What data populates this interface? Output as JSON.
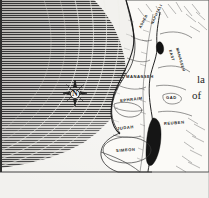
{
  "figure": {
    "kind": "historical-map-engraving",
    "width": 209,
    "height": 198
  },
  "compass": {
    "name": "compass-rose",
    "north_letter": "N"
  },
  "water": {
    "sea_hatch_dark": "#3f3f3f",
    "sea_hatch_light": "#d8d6d2",
    "inland_water_fill": "#111111"
  },
  "colors": {
    "paper": "#f2f1ee",
    "ink": "#1b1b1b",
    "land_fill": "#fbfaf7",
    "border_ink": "#2e2e2e"
  },
  "labels": [
    {
      "id": "asher",
      "text": "ASHER",
      "x": 140,
      "y": 26,
      "rotate": -62,
      "size": "sm"
    },
    {
      "id": "naphtali",
      "text": "NAPHTALI",
      "x": 152,
      "y": 22,
      "rotate": -64,
      "size": "sm"
    },
    {
      "id": "manasseh",
      "text": "MANASSEH",
      "x": 131,
      "y": 76,
      "rotate": 0,
      "size": "md"
    },
    {
      "id": "ephraim",
      "text": "EPHRAIM",
      "x": 128,
      "y": 99,
      "rotate": -6,
      "size": "md"
    },
    {
      "id": "judah",
      "text": "JUDAH",
      "x": 121,
      "y": 127,
      "rotate": -6,
      "size": "md"
    },
    {
      "id": "simeon",
      "text": "SIMEON",
      "x": 120,
      "y": 149,
      "rotate": -4,
      "size": "md"
    },
    {
      "id": "east-manasseh",
      "text": "EAST\nMANASSEH",
      "x": 172,
      "y": 52,
      "rotate": 74,
      "size": "sm"
    },
    {
      "id": "gad",
      "text": "GAD",
      "x": 170,
      "y": 96,
      "rotate": 0,
      "size": "md"
    },
    {
      "id": "reuben",
      "text": "REUBEN",
      "x": 168,
      "y": 122,
      "rotate": -4,
      "size": "md"
    }
  ],
  "label_east_manasseh_lines": {
    "line1": "EAST",
    "line2": "MANASSEH"
  },
  "page_fragments": {
    "fragment_1": "la",
    "fragment_2": "of"
  }
}
